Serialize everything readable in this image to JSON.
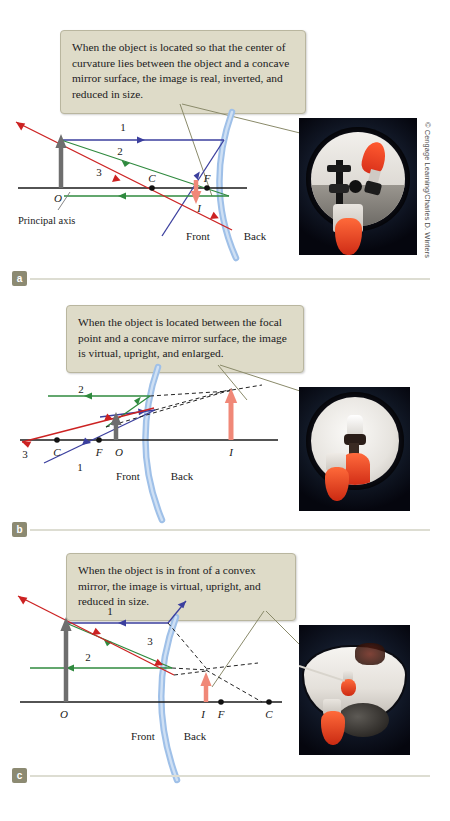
{
  "figure": {
    "credit": "© Cengage Learning/Charles D. Winters",
    "background": "#ffffff"
  },
  "colors": {
    "callout_bg": "#dedbc8",
    "callout_border": "#b9b69f",
    "ray1": "#3b3f9e",
    "ray2": "#2f8a3e",
    "ray3": "#cc2222",
    "mirror": "#9fc0e8",
    "object_arrow": "#6e6e6e",
    "image_arrow": "#f08878",
    "axis": "#1a1a1a",
    "leader": "#8a8a6a",
    "panel_tag": "#8c8a72"
  },
  "panels": [
    {
      "id": "a",
      "tag": "a",
      "caption": "When the object is located so that the center of curvature lies between the object and a concave mirror surface, the image is real, inverted, and reduced in size.",
      "mirror_type": "concave",
      "ray_labels": [
        "1",
        "2",
        "3"
      ],
      "point_labels": [
        "O",
        "C",
        "F",
        "I"
      ],
      "axis_label": "Principal axis",
      "side_labels": [
        "Front",
        "Back"
      ],
      "image_properties": [
        "real",
        "inverted",
        "reduced"
      ],
      "photo_alt": "Concave mirror reflecting an inverted reduced image of a red flask"
    },
    {
      "id": "b",
      "tag": "b",
      "caption": "When the object is located between the focal point and a concave mirror surface, the image is virtual, upright, and enlarged.",
      "mirror_type": "concave",
      "ray_labels": [
        "1",
        "2",
        "3"
      ],
      "point_labels": [
        "C",
        "F",
        "O",
        "I"
      ],
      "axis_label": "",
      "side_labels": [
        "Front",
        "Back"
      ],
      "image_properties": [
        "virtual",
        "upright",
        "enlarged"
      ],
      "photo_alt": "Concave mirror showing an enlarged upright virtual image of a red flask"
    },
    {
      "id": "c",
      "tag": "c",
      "caption": "When the object is in front of a convex mirror, the image is virtual, upright, and reduced in size.",
      "mirror_type": "convex",
      "ray_labels": [
        "1",
        "2",
        "3"
      ],
      "point_labels": [
        "O",
        "I",
        "F",
        "C"
      ],
      "axis_label": "",
      "side_labels": [
        "Front",
        "Back"
      ],
      "image_properties": [
        "virtual",
        "upright",
        "reduced"
      ],
      "photo_alt": "Convex mirror showing a reduced upright virtual image of a red flask"
    }
  ]
}
